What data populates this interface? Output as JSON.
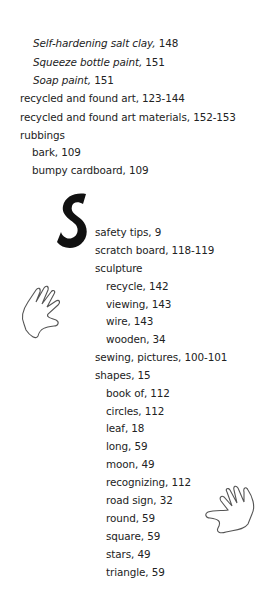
{
  "index": {
    "top_entries": [
      {
        "italic": "Self-hardening salt clay,",
        "pages": " 148",
        "x": 33,
        "y": 36
      },
      {
        "italic": "Squeeze bottle paint,",
        "pages": " 151",
        "x": 33,
        "y": 55
      },
      {
        "italic": "Soap paint,",
        "pages": " 151",
        "x": 33,
        "y": 73
      },
      {
        "text": "recycled and found art, 123-144",
        "x": 20,
        "y": 91
      },
      {
        "text": "recycled and found art materials, 152-153",
        "x": 20,
        "y": 110
      },
      {
        "text": "rubbings",
        "x": 20,
        "y": 128
      },
      {
        "text": "bark, 109",
        "x": 32,
        "y": 145
      },
      {
        "text": "bumpy cardboard, 109",
        "x": 32,
        "y": 163
      }
    ],
    "section_letter": "S",
    "s_entries": [
      {
        "text": "safety tips, 9",
        "x": 95,
        "y": 225
      },
      {
        "text": "scratch board, 118-119",
        "x": 95,
        "y": 243
      },
      {
        "text": "sculpture",
        "x": 95,
        "y": 261
      },
      {
        "text": "recycle, 142",
        "x": 106,
        "y": 279
      },
      {
        "text": "viewing, 143",
        "x": 106,
        "y": 297
      },
      {
        "text": "wire, 143",
        "x": 106,
        "y": 314
      },
      {
        "text": "wooden, 34",
        "x": 106,
        "y": 332
      },
      {
        "text": "sewing, pictures, 100-101",
        "x": 95,
        "y": 350
      },
      {
        "text": "shapes, 15",
        "x": 95,
        "y": 368
      },
      {
        "text": "book of, 112",
        "x": 106,
        "y": 386
      },
      {
        "text": "circles, 112",
        "x": 106,
        "y": 404
      },
      {
        "text": "leaf, 18",
        "x": 106,
        "y": 421
      },
      {
        "text": "long, 59",
        "x": 106,
        "y": 439
      },
      {
        "text": "moon, 49",
        "x": 106,
        "y": 457
      },
      {
        "text": "recognizing, 112",
        "x": 106,
        "y": 475
      },
      {
        "text": "road sign, 32",
        "x": 106,
        "y": 493
      },
      {
        "text": "round, 59",
        "x": 106,
        "y": 511
      },
      {
        "text": "square, 59",
        "x": 106,
        "y": 529
      },
      {
        "text": "stars, 49",
        "x": 106,
        "y": 547
      },
      {
        "text": "triangle, 59",
        "x": 106,
        "y": 565
      }
    ]
  },
  "icons": {
    "left_hand": "hand-outline-icon",
    "right_hand": "hand-outline-icon"
  },
  "colors": {
    "text": "#222222",
    "drop_letter": "#111111",
    "background": "#ffffff"
  }
}
